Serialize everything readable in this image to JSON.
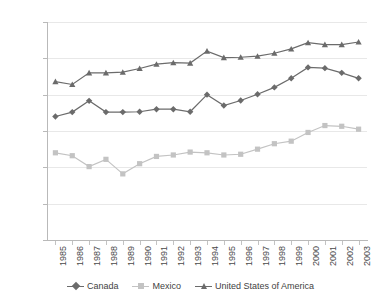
{
  "chart_data": {
    "type": "line",
    "title": "",
    "subtitle": "",
    "xlabel": "",
    "ylabel": "",
    "grid": true,
    "legend_position": "bottom",
    "ylim": [
      60,
      120
    ],
    "ytick_labels": [
      "120",
      "110",
      "100",
      "90",
      "80",
      "70",
      "60"
    ],
    "yticks": [
      120,
      110,
      100,
      90,
      80,
      70,
      60
    ],
    "categories": [
      "1985",
      "1986",
      "1987",
      "1988",
      "1989",
      "1990",
      "1991",
      "1992",
      "1993",
      "1994",
      "1995",
      "1996",
      "1997",
      "1998",
      "1999",
      "2000",
      "2001",
      "2002",
      "2003"
    ],
    "x": [
      1985,
      1986,
      1987,
      1988,
      1989,
      1990,
      1991,
      1992,
      1993,
      1994,
      1995,
      1996,
      1997,
      1998,
      1999,
      2000,
      2001,
      2002,
      2003
    ],
    "series": [
      {
        "name": "Canada",
        "color": "#6b6b6b",
        "marker": "diamond",
        "values": [
          94.0,
          95.2,
          98.3,
          95.2,
          95.2,
          95.3,
          96.0,
          96.0,
          95.3,
          100.0,
          97.0,
          98.4,
          100.1,
          102.0,
          104.5,
          107.5,
          107.3,
          106.0,
          104.5
        ]
      },
      {
        "name": "Mexico",
        "color": "#c3c3c3",
        "marker": "square",
        "values": [
          84.0,
          83.2,
          80.2,
          82.2,
          78.2,
          81.0,
          83.0,
          83.4,
          84.2,
          84.0,
          83.4,
          83.6,
          85.0,
          86.5,
          87.2,
          89.6,
          91.5,
          91.3,
          90.5
        ]
      },
      {
        "name": "United States of America",
        "color": "#6b6b6b",
        "marker": "triangle",
        "values": [
          103.6,
          102.8,
          106.0,
          106.0,
          106.2,
          107.2,
          108.4,
          108.8,
          108.7,
          112.0,
          110.2,
          110.3,
          110.6,
          111.4,
          112.6,
          114.3,
          113.8,
          113.8,
          114.5
        ]
      }
    ]
  },
  "legend": {
    "items": [
      {
        "label": "Canada"
      },
      {
        "label": "Mexico"
      },
      {
        "label": "United States of America"
      }
    ]
  }
}
